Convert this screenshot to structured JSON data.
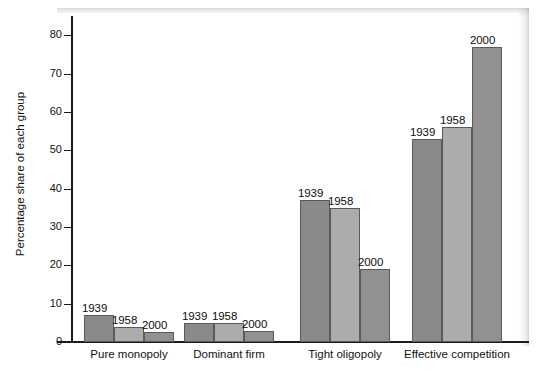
{
  "chart_data": {
    "type": "bar",
    "title": "",
    "xlabel": "",
    "ylabel": "Percentage share of each group",
    "categories": [
      "Pure monopoly",
      "Dominant firm",
      "Tight oligopoly",
      "Effective competition"
    ],
    "series": [
      {
        "name": "1939",
        "color": "#8a8a8a",
        "values": [
          7,
          5,
          37,
          53
        ]
      },
      {
        "name": "1958",
        "color": "#acacac",
        "values": [
          4,
          5,
          35,
          56
        ]
      },
      {
        "name": "2000",
        "color": "#919191",
        "values": [
          2.5,
          3,
          19,
          77
        ]
      }
    ],
    "ylim": [
      0,
      85
    ],
    "yticks": [
      0,
      10,
      20,
      30,
      40,
      50,
      60,
      70,
      80
    ],
    "ytick_labels": [
      "0",
      "10",
      "20",
      "30",
      "40",
      "50",
      "60",
      "70",
      "80"
    ],
    "grid": false,
    "legend": "none",
    "bar_labels_above": true,
    "axis_color": "#1c1c1c",
    "bar_edge_color": "#5a5a5a"
  }
}
